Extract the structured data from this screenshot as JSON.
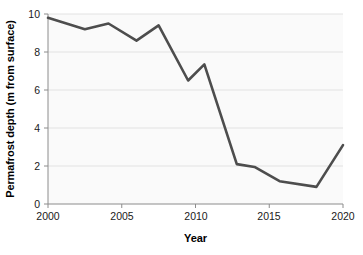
{
  "chart_data": {
    "type": "line",
    "title": "",
    "xlabel": "Year",
    "ylabel": "Permafrost depth (m from surface)",
    "xlim": [
      2000,
      2020
    ],
    "ylim": [
      0,
      10
    ],
    "grid": true,
    "legend": false,
    "legend_position": "none",
    "line_color": "#4d4d4d",
    "background_color": "#fafafa",
    "gridline_color": "#e2e2e2",
    "axis_color": "#8c8c8c",
    "xticks": [
      "2000",
      "2005",
      "2010",
      "2015",
      "2020"
    ],
    "xtick_values": [
      2000,
      2005,
      2010,
      2015,
      2020
    ],
    "yticks": [
      "0",
      "2",
      "4",
      "6",
      "8",
      "10"
    ],
    "ytick_values": [
      0,
      2,
      4,
      6,
      8,
      10
    ],
    "x": [
      2000.0,
      2002.5,
      2004.1,
      2006.0,
      2007.5,
      2009.5,
      2010.6,
      2012.8,
      2014.0,
      2015.7,
      2018.2,
      2020.0
    ],
    "values": [
      9.8,
      9.2,
      9.5,
      8.6,
      9.4,
      6.5,
      7.35,
      2.1,
      1.95,
      1.2,
      0.9,
      3.1
    ],
    "series": [
      {
        "name": "Permafrost depth",
        "x": [
          2000.0,
          2002.5,
          2004.1,
          2006.0,
          2007.5,
          2009.5,
          2010.6,
          2012.8,
          2014.0,
          2015.7,
          2018.2,
          2020.0
        ],
        "values": [
          9.8,
          9.2,
          9.5,
          8.6,
          9.4,
          6.5,
          7.35,
          2.1,
          1.95,
          1.2,
          0.9,
          3.1
        ]
      }
    ]
  }
}
